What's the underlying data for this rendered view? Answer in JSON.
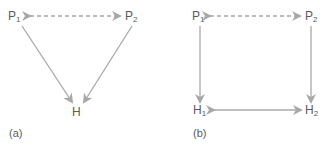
{
  "diagrams": [
    {
      "caption": "(a)",
      "nodes": [
        {
          "id": "P1",
          "base": "P",
          "sub": "1"
        },
        {
          "id": "P2",
          "base": "P",
          "sub": "2"
        },
        {
          "id": "H",
          "base": "H",
          "sub": ""
        }
      ],
      "edges": [
        {
          "from": "P1",
          "to": "P2",
          "style": "dashed",
          "direction": "both"
        },
        {
          "from": "P1",
          "to": "H",
          "style": "solid",
          "direction": "forward"
        },
        {
          "from": "P2",
          "to": "H",
          "style": "solid",
          "direction": "forward"
        }
      ]
    },
    {
      "caption": "(b)",
      "nodes": [
        {
          "id": "P1",
          "base": "P",
          "sub": "1"
        },
        {
          "id": "P2",
          "base": "P",
          "sub": "2"
        },
        {
          "id": "H1",
          "base": "H",
          "sub": "1"
        },
        {
          "id": "H2",
          "base": "H",
          "sub": "2"
        }
      ],
      "edges": [
        {
          "from": "P1",
          "to": "P2",
          "style": "dashed",
          "direction": "both"
        },
        {
          "from": "P1",
          "to": "H1",
          "style": "solid",
          "direction": "forward"
        },
        {
          "from": "P2",
          "to": "H2",
          "style": "solid",
          "direction": "forward"
        },
        {
          "from": "H1",
          "to": "H2",
          "style": "solid",
          "direction": "both"
        }
      ]
    }
  ],
  "colors": {
    "arrow": "#a8a8a8",
    "text": "#5a5a5a"
  }
}
